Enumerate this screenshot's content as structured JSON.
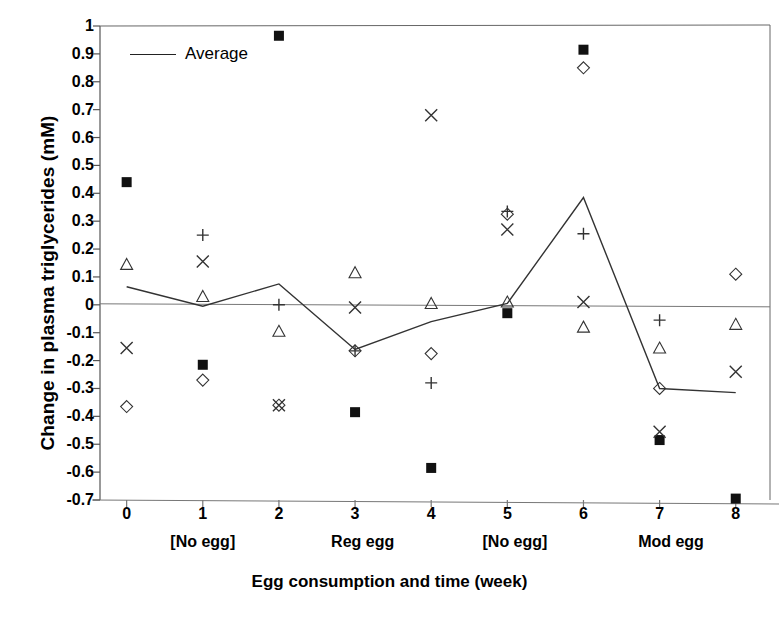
{
  "figure": {
    "caption_fragment": ""
  },
  "chart_data": {
    "type": "scatter",
    "title": "",
    "xlabel": "Egg consumption and time (week)",
    "ylabel": "Change in plasma triglycerides (mM)",
    "xlim": [
      -0.35,
      8.45
    ],
    "ylim": [
      -0.7,
      1
    ],
    "grid": false,
    "zero_line": true,
    "legend": {
      "position": "top-left-inside",
      "entries": [
        {
          "label": "Average",
          "marker": "line"
        }
      ]
    },
    "x": [
      0,
      1,
      2,
      3,
      4,
      5,
      6,
      7,
      8
    ],
    "xtick_labels": [
      "0",
      "1",
      "2",
      "3",
      "4",
      "5",
      "6",
      "7",
      "8"
    ],
    "ytick_labels": [
      "1",
      "0.9",
      "0.8",
      "0.7",
      "0.6",
      "0.5",
      "0.4",
      "0.3",
      "0.2",
      "0.1",
      "0",
      "-0.1",
      "-0.2",
      "-0.3",
      "-0.4",
      "-0.5",
      "-0.6",
      "-0.7"
    ],
    "ytick_values": [
      1,
      0.9,
      0.8,
      0.7,
      0.6,
      0.5,
      0.4,
      0.3,
      0.2,
      0.1,
      0,
      -0.1,
      -0.2,
      -0.3,
      -0.4,
      -0.5,
      -0.6,
      -0.7
    ],
    "x_group_labels": [
      {
        "label": "[No egg]",
        "center_x": 1.0
      },
      {
        "label": "Reg egg",
        "center_x": 3.1
      },
      {
        "label": "[No egg]",
        "center_x": 5.1
      },
      {
        "label": "Mod egg",
        "center_x": 7.15
      }
    ],
    "series": [
      {
        "name": "subject-square",
        "marker": "filled-square",
        "points": [
          {
            "x": 0,
            "y": 0.44
          },
          {
            "x": 1,
            "y": -0.215
          },
          {
            "x": 2,
            "y": 0.965
          },
          {
            "x": 3,
            "y": -0.385
          },
          {
            "x": 4,
            "y": -0.585
          },
          {
            "x": 5,
            "y": -0.03
          },
          {
            "x": 6,
            "y": 0.915
          },
          {
            "x": 7,
            "y": -0.485
          },
          {
            "x": 8,
            "y": -0.695
          }
        ]
      },
      {
        "name": "subject-diamond",
        "marker": "open-diamond",
        "points": [
          {
            "x": 0,
            "y": -0.365
          },
          {
            "x": 1,
            "y": -0.27
          },
          {
            "x": 2,
            "y": -0.36
          },
          {
            "x": 3,
            "y": -0.165
          },
          {
            "x": 4,
            "y": -0.175
          },
          {
            "x": 5,
            "y": 0.325
          },
          {
            "x": 6,
            "y": 0.85
          },
          {
            "x": 7,
            "y": -0.3
          },
          {
            "x": 8,
            "y": 0.11
          }
        ]
      },
      {
        "name": "subject-triangle",
        "marker": "open-triangle",
        "points": [
          {
            "x": 0,
            "y": 0.145
          },
          {
            "x": 1,
            "y": 0.03
          },
          {
            "x": 2,
            "y": -0.095
          },
          {
            "x": 3,
            "y": 0.115
          },
          {
            "x": 4,
            "y": 0.005
          },
          {
            "x": 5,
            "y": 0.01
          },
          {
            "x": 6,
            "y": -0.08
          },
          {
            "x": 7,
            "y": -0.155
          },
          {
            "x": 8,
            "y": -0.07
          }
        ]
      },
      {
        "name": "subject-cross",
        "marker": "x-cross",
        "points": [
          {
            "x": 0,
            "y": -0.155
          },
          {
            "x": 1,
            "y": 0.155
          },
          {
            "x": 2,
            "y": -0.36
          },
          {
            "x": 3,
            "y": -0.01
          },
          {
            "x": 4,
            "y": 0.68
          },
          {
            "x": 5,
            "y": 0.27
          },
          {
            "x": 6,
            "y": 0.01
          },
          {
            "x": 7,
            "y": -0.455
          },
          {
            "x": 8,
            "y": -0.24
          }
        ]
      },
      {
        "name": "subject-plus",
        "marker": "plus",
        "points": [
          {
            "x": 1,
            "y": 0.25
          },
          {
            "x": 2,
            "y": 0.0
          },
          {
            "x": 3,
            "y": -0.165
          },
          {
            "x": 4,
            "y": -0.28
          },
          {
            "x": 5,
            "y": 0.335
          },
          {
            "x": 6,
            "y": 0.255
          },
          {
            "x": 7,
            "y": -0.055
          }
        ]
      },
      {
        "name": "Average",
        "marker": "line",
        "points": [
          {
            "x": 0,
            "y": 0.065
          },
          {
            "x": 1,
            "y": -0.005
          },
          {
            "x": 2,
            "y": 0.075
          },
          {
            "x": 3,
            "y": -0.16
          },
          {
            "x": 4,
            "y": -0.06
          },
          {
            "x": 5,
            "y": 0.005
          },
          {
            "x": 6,
            "y": 0.385
          },
          {
            "x": 7,
            "y": -0.3
          },
          {
            "x": 8,
            "y": -0.315
          }
        ]
      }
    ]
  }
}
